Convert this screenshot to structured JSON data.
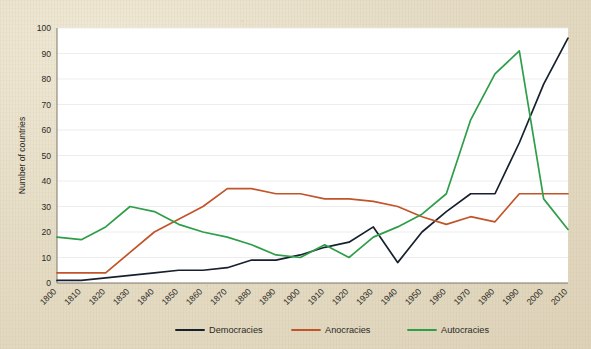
{
  "chart_data": {
    "type": "line",
    "title": "",
    "subtitle": "",
    "xlabel": "",
    "ylabel": "Number of countries",
    "xlim": [
      1800,
      2010
    ],
    "ylim": [
      0,
      100
    ],
    "grid": true,
    "legend_position": "bottom",
    "x": [
      1800,
      1810,
      1820,
      1830,
      1840,
      1850,
      1860,
      1870,
      1880,
      1890,
      1900,
      1910,
      1920,
      1930,
      1940,
      1950,
      1960,
      1970,
      1980,
      1990,
      2000,
      2010
    ],
    "xtick_labels": [
      "1800",
      "1810",
      "1820",
      "1830",
      "1840",
      "1850",
      "1860",
      "1870",
      "1880",
      "1890",
      "1900",
      "1910",
      "1920",
      "1930",
      "1940",
      "1950",
      "1960",
      "1970",
      "1980",
      "1990",
      "2000",
      "2010"
    ],
    "ytick_labels": [
      "0",
      "10",
      "20",
      "30",
      "40",
      "50",
      "60",
      "70",
      "80",
      "90",
      "100"
    ],
    "ytick_values": [
      0,
      10,
      20,
      30,
      40,
      50,
      60,
      70,
      80,
      90,
      100
    ],
    "series": [
      {
        "name": "Democracies",
        "color": "#16212e",
        "values": [
          1,
          1,
          2,
          3,
          4,
          5,
          5,
          6,
          9,
          9,
          11,
          14,
          16,
          22,
          8,
          20,
          28,
          35,
          35,
          55,
          78,
          96
        ]
      },
      {
        "name": "Anocracies",
        "color": "#c25429",
        "values": [
          4,
          4,
          4,
          12,
          20,
          25,
          30,
          37,
          37,
          35,
          35,
          33,
          33,
          32,
          30,
          26,
          23,
          26,
          24,
          35,
          35,
          35
        ]
      },
      {
        "name": "Autocracies",
        "color": "#2e9e48",
        "values": [
          18,
          17,
          22,
          30,
          28,
          23,
          20,
          18,
          15,
          11,
          10,
          15,
          10,
          18,
          22,
          27,
          35,
          64,
          82,
          91,
          33,
          21
        ]
      }
    ]
  },
  "legend": {
    "items": [
      {
        "label": "Democracies",
        "color": "#16212e"
      },
      {
        "label": "Anocracies",
        "color": "#c25429"
      },
      {
        "label": "Autocracies",
        "color": "#2e9e48"
      }
    ]
  }
}
